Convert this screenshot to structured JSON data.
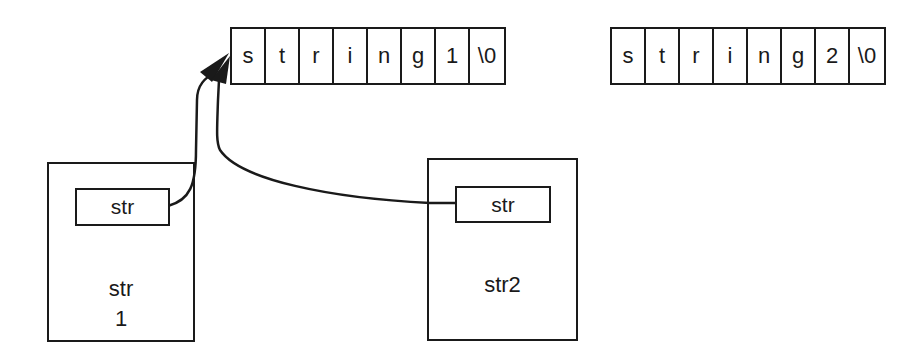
{
  "arrays": [
    {
      "name": "string1-array",
      "cells": [
        "s",
        "t",
        "r",
        "i",
        "n",
        "g",
        "1",
        "\\0"
      ]
    },
    {
      "name": "string2-array",
      "cells": [
        "s",
        "t",
        "r",
        "i",
        "n",
        "g",
        "2",
        "\\0"
      ]
    }
  ],
  "boxes": [
    {
      "name": "str1-box",
      "field_label": "str",
      "label_line1": "str",
      "label_line2": "1"
    },
    {
      "name": "str2-box",
      "field_label": "str",
      "label_line1": "str2"
    }
  ],
  "arrows": [
    {
      "from": "str1-box.field",
      "to": "string1-array.cell0"
    },
    {
      "from": "str2-box.field",
      "to": "string1-array.cell0"
    }
  ]
}
